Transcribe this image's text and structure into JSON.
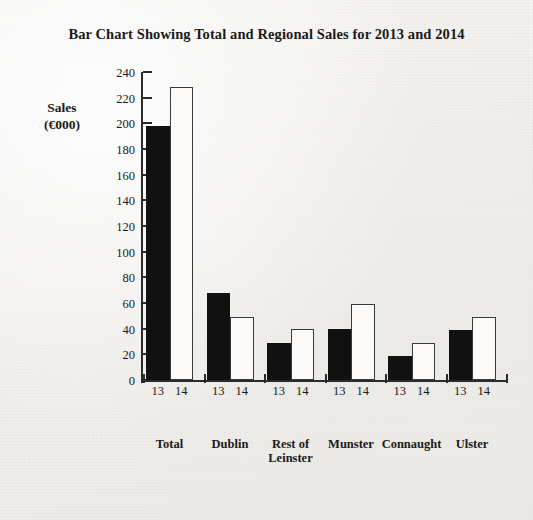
{
  "chart_data": {
    "type": "bar",
    "title": "Bar Chart Showing Total and Regional Sales for 2013 and 2014",
    "xlabel": "",
    "ylabel": "Sales (€000)",
    "ylabel_lines": [
      "Sales",
      "(€000)"
    ],
    "ylim": [
      0,
      240
    ],
    "yticks": [
      0,
      20,
      40,
      60,
      80,
      100,
      120,
      140,
      160,
      180,
      200,
      220,
      240
    ],
    "ytick_labels": [
      "0",
      "20",
      "40",
      "60",
      "80",
      "100",
      "120",
      "140",
      "160",
      "180",
      "200",
      "220",
      "240"
    ],
    "grid": false,
    "legend": "none",
    "categories": [
      "Total",
      "Dublin",
      "Rest of Leinster",
      "Munster",
      "Connaught",
      "Ulster"
    ],
    "category_label_lines": [
      [
        "Total"
      ],
      [
        "Dublin"
      ],
      [
        "Rest of",
        "Leinster"
      ],
      [
        "Munster"
      ],
      [
        "Connaught"
      ],
      [
        "Ulster"
      ]
    ],
    "group_tick_labels": [
      "13",
      "14"
    ],
    "series": [
      {
        "name": "13",
        "style": "filled-black",
        "color": "#111111",
        "values": [
          198,
          68,
          29,
          40,
          19,
          39
        ]
      },
      {
        "name": "14",
        "style": "hollow-white",
        "color": "#fbfaf8",
        "values": [
          228,
          49,
          40,
          59,
          29,
          49
        ]
      }
    ]
  },
  "page": {
    "background_color": "#f1efec",
    "ink_color": "#1a1a1a"
  }
}
